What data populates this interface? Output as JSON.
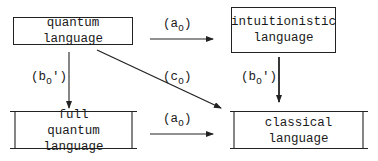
{
  "nodes": {
    "quantum": {
      "lines": [
        "quantum language"
      ]
    },
    "intuitionistic": {
      "lines": [
        "intuitionistic",
        "language"
      ]
    },
    "full_quantum": {
      "lines": [
        "full",
        "quantum language"
      ]
    },
    "classical": {
      "lines": [
        "classical language"
      ]
    }
  },
  "edges": {
    "top": {
      "label": "a",
      "sub": "o",
      "prime": "",
      "from": "quantum language",
      "to": "intuitionistic language"
    },
    "bottom": {
      "label": "a",
      "sub": "o",
      "prime": "",
      "from": "full quantum language",
      "to": "classical language"
    },
    "left": {
      "label": "b",
      "sub": "o",
      "prime": "'",
      "from": "quantum language",
      "to": "full quantum language"
    },
    "right": {
      "label": "b",
      "sub": "o",
      "prime": "'",
      "from": "intuitionistic language",
      "to": "classical language"
    },
    "diagonal": {
      "label": "c",
      "sub": "o",
      "prime": "",
      "from": "quantum language",
      "to": "classical language"
    }
  }
}
